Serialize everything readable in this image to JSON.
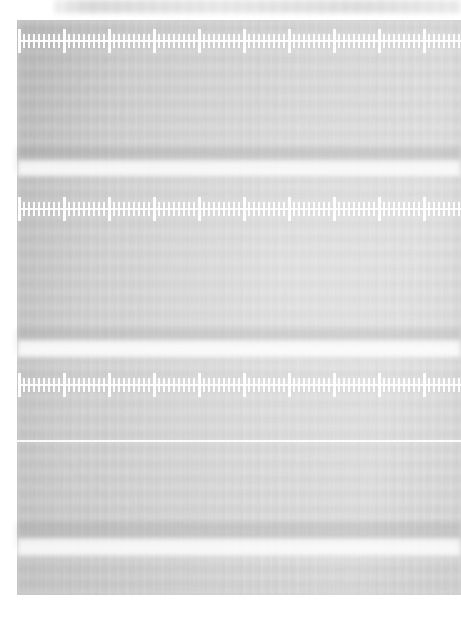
{
  "document": {
    "kind": "blurred-ruler-scan",
    "title": "",
    "page_width": 461,
    "page_height": 618,
    "background_color": "#ffffff",
    "paper_color": "#c9c9c9",
    "tick_color": "#ffffff",
    "band_dark_color": "#787878",
    "band_light_color": "#ffffff",
    "focus": "out-of-focus",
    "legible_text": false
  },
  "page_margins": {
    "left": 17,
    "top": 20,
    "right": 0,
    "bottom": 23
  },
  "top_strip": {
    "label": "",
    "left": 55,
    "top": 0,
    "width": 406,
    "height": 13
  },
  "rulers": [
    {
      "name": "ruler-top",
      "top": 28,
      "height": 26,
      "minor_spacing_px": 5,
      "major_every": 9,
      "start_x": 18,
      "end_x": 461,
      "labels": []
    },
    {
      "name": "ruler-middle",
      "top": 196,
      "height": 26,
      "minor_spacing_px": 5,
      "major_every": 9,
      "start_x": 18,
      "end_x": 461,
      "labels": []
    },
    {
      "name": "ruler-bottom",
      "top": 372,
      "height": 26,
      "minor_spacing_px": 5,
      "major_every": 9,
      "start_x": 18,
      "end_x": 461,
      "labels": []
    }
  ],
  "bands": [
    {
      "name": "band-dark-upper",
      "tone": "dark",
      "top": 148,
      "height": 24,
      "opacity": 0.45
    },
    {
      "name": "band-light-upper",
      "tone": "light",
      "top": 160,
      "height": 16,
      "opacity": 0.92
    },
    {
      "name": "band-dark-mid",
      "tone": "dark",
      "top": 330,
      "height": 22,
      "opacity": 0.42
    },
    {
      "name": "band-light-mid",
      "tone": "light",
      "top": 340,
      "height": 17,
      "opacity": 0.95
    },
    {
      "name": "band-hairline",
      "tone": "hair",
      "top": 440,
      "height": 2,
      "opacity": 0.95
    },
    {
      "name": "band-dark-lower",
      "tone": "dark",
      "top": 523,
      "height": 24,
      "opacity": 0.4
    },
    {
      "name": "band-light-lower",
      "tone": "light",
      "top": 538,
      "height": 18,
      "opacity": 0.9
    }
  ],
  "caption": {
    "text": " ",
    "visible": true,
    "legible": false,
    "top": 592
  }
}
